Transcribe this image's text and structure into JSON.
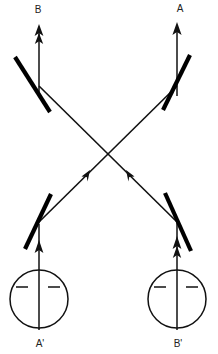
{
  "diagram": {
    "type": "optics-ray-diagram",
    "title": "",
    "background_color": "#ffffff",
    "stroke_color": "#111111",
    "mirror_color": "#000000",
    "canvas": {
      "width": 218,
      "height": 354
    },
    "labels": {
      "top_left": "B",
      "top_right": "A",
      "bottom_left": "A'",
      "bottom_right": "B'"
    },
    "label_positions": {
      "top_left": {
        "x": 38,
        "y": 9
      },
      "top_right": {
        "x": 180,
        "y": 9
      },
      "bottom_left": {
        "x": 40,
        "y": 344
      },
      "bottom_right": {
        "x": 178,
        "y": 344
      }
    },
    "sources": [
      {
        "name": "source-a-prime",
        "label": "A'",
        "cx": 39,
        "cy": 299,
        "r": 29,
        "tick_left": {
          "x1": 18,
          "y1": 287,
          "x2": 27,
          "y2": 287
        },
        "tick_right": {
          "x1": 48,
          "y1": 287,
          "x2": 58,
          "y2": 287
        }
      },
      {
        "name": "source-b-prime",
        "label": "B'",
        "cx": 177,
        "cy": 299,
        "r": 29,
        "tick_left": {
          "x1": 156,
          "y1": 287,
          "x2": 165,
          "y2": 287
        },
        "tick_right": {
          "x1": 186,
          "y1": 287,
          "x2": 196,
          "y2": 287
        }
      }
    ],
    "mirrors": [
      {
        "name": "mirror-top-left",
        "x1": 15,
        "y1": 57,
        "x2": 50,
        "y2": 112
      },
      {
        "name": "mirror-top-right",
        "x1": 190,
        "y1": 55,
        "x2": 163,
        "y2": 110
      },
      {
        "name": "mirror-bottom-left",
        "x1": 25,
        "y1": 249,
        "x2": 51,
        "y2": 194
      },
      {
        "name": "mirror-bottom-right",
        "x1": 191,
        "y1": 251,
        "x2": 165,
        "y2": 193
      }
    ],
    "rays": [
      {
        "name": "ray-vertical-b-top",
        "from": {
          "x": 39,
          "y": 86
        },
        "to": {
          "x": 39,
          "y": 26
        },
        "arrow": "double-up"
      },
      {
        "name": "ray-vertical-a-top",
        "from": {
          "x": 177,
          "y": 84
        },
        "to": {
          "x": 177,
          "y": 24
        },
        "arrow": "single-up"
      },
      {
        "name": "ray-vertical-a-prime",
        "from": {
          "x": 39,
          "y": 328
        },
        "to": {
          "x": 39,
          "y": 222
        },
        "arrow": "single-up"
      },
      {
        "name": "ray-vertical-b-prime",
        "from": {
          "x": 177,
          "y": 328
        },
        "to": {
          "x": 177,
          "y": 220
        },
        "arrow": "double-up"
      },
      {
        "name": "ray-diagonal-a-prime-to-a",
        "from": {
          "x": 39,
          "y": 222
        },
        "to": {
          "x": 177,
          "y": 86
        },
        "arrow": "mid-up-right"
      },
      {
        "name": "ray-diagonal-b-prime-to-b",
        "from": {
          "x": 177,
          "y": 222
        },
        "to": {
          "x": 39,
          "y": 86
        },
        "arrow": "mid-up-left"
      }
    ],
    "crossing_point": {
      "x": 108,
      "y": 154
    },
    "arrow_markers": [
      {
        "name": "arrowhead-b-top",
        "x": 39,
        "y": 26,
        "direction": "up"
      },
      {
        "name": "arrowhead-b-top-second",
        "x": 39,
        "y": 36,
        "direction": "up"
      },
      {
        "name": "arrowhead-a-top",
        "x": 177,
        "y": 24,
        "direction": "up"
      },
      {
        "name": "arrowhead-a-prime",
        "x": 39,
        "y": 249,
        "direction": "up"
      },
      {
        "name": "arrowhead-b-prime",
        "x": 177,
        "y": 245,
        "direction": "up"
      },
      {
        "name": "arrowhead-b-prime-second",
        "x": 177,
        "y": 256,
        "direction": "up"
      },
      {
        "name": "arrowhead-cross-left",
        "x": 86,
        "y": 176,
        "direction": "up-right"
      },
      {
        "name": "arrowhead-cross-right",
        "x": 130,
        "y": 176,
        "direction": "up-left"
      }
    ]
  }
}
